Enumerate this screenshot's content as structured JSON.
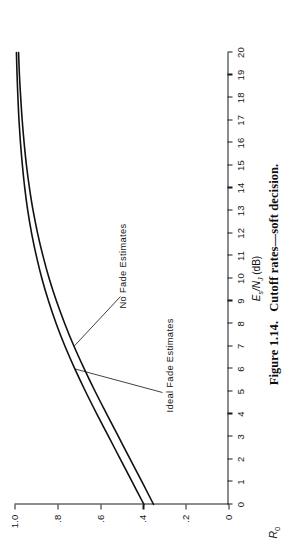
{
  "figure": {
    "caption_label": "Figure 1.14.",
    "caption_text": "Cutoff rates—soft decision."
  },
  "chart_data": {
    "type": "line",
    "title": "Cutoff rates—soft decision.",
    "xlabel": "Es /NJ (dB)",
    "ylabel": "R0",
    "xlim": [
      0,
      20
    ],
    "ylim": [
      0,
      1.0
    ],
    "grid": false,
    "legend": "inline-annotations",
    "x_ticks": [
      0,
      1,
      2,
      3,
      4,
      5,
      6,
      7,
      8,
      9,
      10,
      11,
      12,
      13,
      14,
      15,
      16,
      17,
      18,
      19,
      20
    ],
    "x_tick_labels": [
      "0",
      "1",
      "2",
      "3",
      "4",
      "5",
      "6",
      "7",
      "8",
      "9",
      "10",
      "11",
      "12",
      "13",
      "14",
      "15",
      "16",
      "17",
      "18",
      "19",
      "20"
    ],
    "y_ticks": [
      0,
      0.2,
      0.4,
      0.6,
      0.8,
      1.0
    ],
    "y_tick_labels": [
      "0",
      ".2",
      ".4",
      ".6",
      ".8",
      "1.0"
    ],
    "x": [
      0,
      1,
      2,
      3,
      4,
      5,
      6,
      7,
      8,
      9,
      10,
      11,
      12,
      13,
      14,
      15,
      16,
      17,
      18,
      19,
      20
    ],
    "series": [
      {
        "name": "Ideal Fade Estimates",
        "values": [
          0.395,
          0.45,
          0.505,
          0.56,
          0.615,
          0.668,
          0.718,
          0.764,
          0.805,
          0.841,
          0.872,
          0.898,
          0.92,
          0.938,
          0.952,
          0.963,
          0.972,
          0.979,
          0.984,
          0.988,
          0.991
        ]
      },
      {
        "name": "No Fade Estimates",
        "values": [
          0.35,
          0.404,
          0.459,
          0.514,
          0.569,
          0.623,
          0.674,
          0.722,
          0.765,
          0.804,
          0.838,
          0.867,
          0.892,
          0.913,
          0.93,
          0.944,
          0.955,
          0.964,
          0.971,
          0.977,
          0.981
        ]
      }
    ],
    "annotations": [
      {
        "text": "Ideal Fade Estimates",
        "points_to_series": "Ideal Fade Estimates"
      },
      {
        "text": "No Fade Estimates",
        "points_to_series": "No Fade Estimates"
      }
    ]
  },
  "axis": {
    "x_title_main": "E",
    "x_title_sub": "s",
    "x_title_rest": "/N",
    "x_title_sub2": "J",
    "x_title_units": "(dB)",
    "y_title_main": "R",
    "y_title_sub": "0"
  },
  "colors": {
    "ink": "#1a1a1a",
    "paper": "#ffffff",
    "curve": "#111111"
  }
}
